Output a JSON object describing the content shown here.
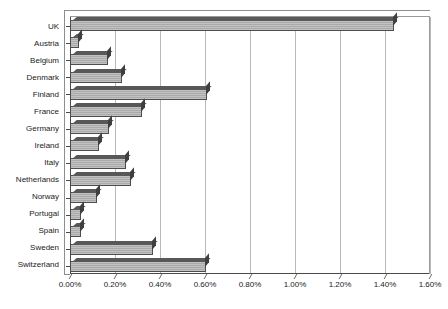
{
  "chart_data": {
    "type": "bar",
    "orientation": "horizontal",
    "title": "",
    "subtitle": "",
    "xlabel": "",
    "ylabel": "",
    "categories": [
      "UK",
      "Austria",
      "Belgium",
      "Denmark",
      "Finland",
      "France",
      "Germany",
      "Ireland",
      "Italy",
      "Netherlands",
      "Norway",
      "Portugal",
      "Spain",
      "Sweden",
      "Switzerland"
    ],
    "values": [
      1.44,
      0.04,
      0.17,
      0.23,
      0.61,
      0.32,
      0.175,
      0.13,
      0.25,
      0.27,
      0.12,
      0.05,
      0.05,
      0.37,
      0.605
    ],
    "value_unit": "%",
    "xlim": [
      0.0,
      1.6
    ],
    "xticks": [
      0.0,
      0.2,
      0.4,
      0.6,
      0.8,
      1.0,
      1.2,
      1.4,
      1.6
    ],
    "xtick_labels": [
      "0.00%",
      "0.20%",
      "0.40%",
      "0.60%",
      "0.80%",
      "1.00%",
      "1.20%",
      "1.40%",
      "1.60%"
    ],
    "grid": true,
    "grid_axis": "x",
    "legend": null,
    "legend_position": "none",
    "bar_fill_color": "#b3b3b3",
    "bar_edge_color": "#4d4d4d",
    "bar_top_face_color": "#585858",
    "bar_side_face_color": "#3f3f3f",
    "gridline_color": "#b9b9b9",
    "axis_color": "#4a4a4a",
    "background_color": "#ffffff",
    "style": "3d-bar"
  }
}
